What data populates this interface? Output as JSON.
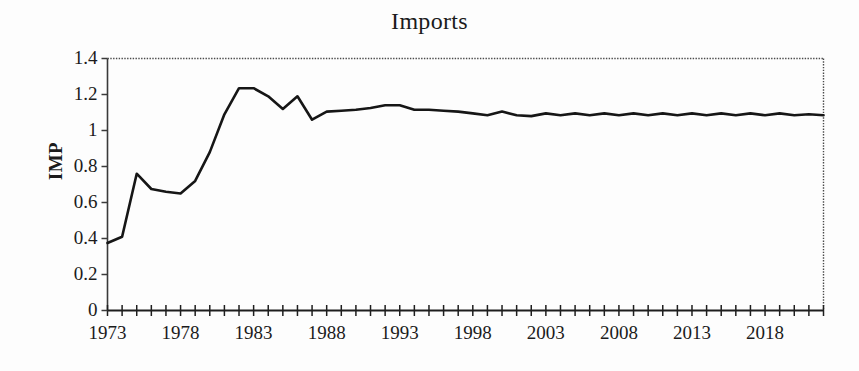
{
  "chart_data": {
    "type": "line",
    "title": "Imports",
    "xlabel": "",
    "ylabel": "IMP",
    "xlim": [
      1973,
      2022
    ],
    "ylim": [
      0,
      1.4
    ],
    "grid": false,
    "legend": null,
    "y_ticks": [
      "1.4",
      "1.2",
      "1",
      "0.8",
      "0.6",
      "0.4",
      "0.2",
      "0"
    ],
    "y_tick_values": [
      1.4,
      1.2,
      1.0,
      0.8,
      0.6,
      0.4,
      0.2,
      0
    ],
    "x_ticks": [
      "1973",
      "1978",
      "1983",
      "1988",
      "1993",
      "1998",
      "2003",
      "2008",
      "2013",
      "2018"
    ],
    "x_tick_values": [
      1973,
      1978,
      1983,
      1988,
      1993,
      1998,
      2003,
      2008,
      2013,
      2018
    ],
    "x_minor_tick_step": 1,
    "line_color": "#161616",
    "line_width": 2.6,
    "series": [
      {
        "name": "IMP",
        "x": [
          1973,
          1974,
          1975,
          1976,
          1977,
          1978,
          1979,
          1980,
          1981,
          1982,
          1983,
          1984,
          1985,
          1986,
          1987,
          1988,
          1989,
          1990,
          1991,
          1992,
          1993,
          1994,
          1995,
          1996,
          1997,
          1998,
          1999,
          2000,
          2001,
          2002,
          2003,
          2004,
          2005,
          2006,
          2007,
          2008,
          2009,
          2010,
          2011,
          2012,
          2013,
          2014,
          2015,
          2016,
          2017,
          2018,
          2019,
          2020,
          2021,
          2022
        ],
        "values": [
          0.375,
          0.41,
          0.76,
          0.675,
          0.66,
          0.65,
          0.72,
          0.88,
          1.09,
          1.235,
          1.235,
          1.19,
          1.12,
          1.19,
          1.06,
          1.105,
          1.11,
          1.115,
          1.125,
          1.14,
          1.14,
          1.115,
          1.115,
          1.11,
          1.105,
          1.095,
          1.085,
          1.105,
          1.085,
          1.08,
          1.095,
          1.085,
          1.095,
          1.085,
          1.095,
          1.085,
          1.095,
          1.085,
          1.095,
          1.085,
          1.095,
          1.085,
          1.095,
          1.085,
          1.095,
          1.085,
          1.095,
          1.085,
          1.09,
          1.085
        ]
      }
    ]
  }
}
